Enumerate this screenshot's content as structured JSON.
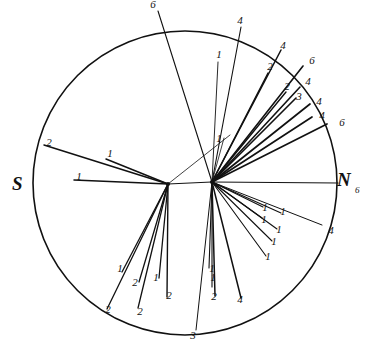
{
  "figure": {
    "background_color": "#ffffff",
    "ink_color": "#111111",
    "circle": {
      "cx": 185,
      "cy": 183,
      "r": 152,
      "stroke_width": 1.6
    },
    "hubs": [
      {
        "name": "left-hub",
        "cx": 168,
        "cy": 184
      },
      {
        "name": "right-hub",
        "cx": 212,
        "cy": 182
      }
    ],
    "cardinals": [
      {
        "name": "south-label",
        "text": "S",
        "x": 12,
        "y": 190
      },
      {
        "name": "north-label",
        "text": "N",
        "x": 337,
        "y": 186
      },
      {
        "name": "north-count",
        "text": "6",
        "x": 355,
        "y": 193
      }
    ]
  },
  "chart_data": {
    "type": "scatter",
    "xlabel": "",
    "ylabel": "",
    "axis_labels": [
      "S",
      "N"
    ],
    "legend": [],
    "grid": false,
    "rays": [
      {
        "hub": "right-hub",
        "x2": 158,
        "y2": 11,
        "label": "6",
        "lx": 153,
        "ly": 8,
        "w": 1.1
      },
      {
        "hub": "right-hub",
        "x2": 241,
        "y2": 27,
        "label": "4",
        "lx": 240,
        "ly": 24,
        "w": 1.1
      },
      {
        "hub": "right-hub",
        "x2": 281,
        "y2": 50,
        "label": "4",
        "lx": 283,
        "ly": 49,
        "w": 1.5
      },
      {
        "hub": "right-hub",
        "x2": 218,
        "y2": 62,
        "label": "1",
        "lx": 219,
        "ly": 58,
        "w": 0.9
      },
      {
        "hub": "right-hub",
        "x2": 268,
        "y2": 73,
        "label": "2",
        "lx": 270,
        "ly": 70,
        "w": 1.4
      },
      {
        "hub": "right-hub",
        "x2": 303,
        "y2": 66,
        "label": "6",
        "lx": 312,
        "ly": 64,
        "w": 1.6
      },
      {
        "hub": "right-hub",
        "x2": 286,
        "y2": 92,
        "label": "2",
        "lx": 287,
        "ly": 90,
        "w": 1.4
      },
      {
        "hub": "right-hub",
        "x2": 300,
        "y2": 87,
        "label": "4",
        "lx": 308,
        "ly": 85,
        "w": 1.6
      },
      {
        "hub": "right-hub",
        "x2": 296,
        "y2": 98,
        "label": "3",
        "lx": 299,
        "ly": 100,
        "w": 1.6
      },
      {
        "hub": "right-hub",
        "x2": 310,
        "y2": 104,
        "label": "4",
        "lx": 319,
        "ly": 105,
        "w": 1.7
      },
      {
        "hub": "right-hub",
        "x2": 312,
        "y2": 117,
        "label": "4",
        "lx": 322,
        "ly": 119,
        "w": 1.7
      },
      {
        "hub": "right-hub",
        "x2": 327,
        "y2": 124,
        "label": "6",
        "lx": 342,
        "ly": 126,
        "w": 1.7
      },
      {
        "hub": "right-hub",
        "x2": 224,
        "y2": 138,
        "label": "1",
        "lx": 219,
        "ly": 142,
        "w": 0.8
      },
      {
        "hub": "right-hub",
        "x2": 338,
        "y2": 183,
        "label": "",
        "lx": 0,
        "ly": 0,
        "w": 1.2
      },
      {
        "hub": "right-hub",
        "x2": 263,
        "y2": 207,
        "label": "1",
        "lx": 265,
        "ly": 211,
        "w": 1.1
      },
      {
        "hub": "right-hub",
        "x2": 262,
        "y2": 218,
        "label": "1",
        "lx": 264,
        "ly": 223,
        "w": 1.1
      },
      {
        "hub": "right-hub",
        "x2": 281,
        "y2": 213,
        "label": "1",
        "lx": 283,
        "ly": 215,
        "w": 1.1
      },
      {
        "hub": "right-hub",
        "x2": 277,
        "y2": 229,
        "label": "1",
        "lx": 279,
        "ly": 233,
        "w": 1.1
      },
      {
        "hub": "right-hub",
        "x2": 272,
        "y2": 241,
        "label": "1",
        "lx": 274,
        "ly": 245,
        "w": 1.1
      },
      {
        "hub": "right-hub",
        "x2": 266,
        "y2": 256,
        "label": "1",
        "lx": 268,
        "ly": 260,
        "w": 1.1
      },
      {
        "hub": "right-hub",
        "x2": 322,
        "y2": 225,
        "label": "4",
        "lx": 331,
        "ly": 234,
        "w": 1.0
      },
      {
        "hub": "right-hub",
        "x2": 209,
        "y2": 268,
        "label": "1",
        "lx": 212,
        "ly": 272,
        "w": 1.1
      },
      {
        "hub": "right-hub",
        "x2": 212,
        "y2": 287,
        "label": "1",
        "lx": 213,
        "ly": 281,
        "w": 1.1
      },
      {
        "hub": "right-hub",
        "x2": 215,
        "y2": 296,
        "label": "2",
        "lx": 214,
        "ly": 300,
        "w": 1.5
      },
      {
        "hub": "right-hub",
        "x2": 241,
        "y2": 298,
        "label": "4",
        "lx": 240,
        "ly": 303,
        "w": 1.5
      },
      {
        "hub": "right-hub",
        "x2": 196,
        "y2": 330,
        "label": "3",
        "lx": 193,
        "ly": 339,
        "w": 1.0
      },
      {
        "hub": "left-hub",
        "x2": 44,
        "y2": 145,
        "label": "2",
        "lx": 49,
        "ly": 146,
        "w": 1.5
      },
      {
        "hub": "left-hub",
        "x2": 106,
        "y2": 159,
        "label": "1",
        "lx": 110,
        "ly": 157,
        "w": 1.5
      },
      {
        "hub": "left-hub",
        "x2": 74,
        "y2": 180,
        "label": "1",
        "lx": 79,
        "ly": 180,
        "w": 1.5
      },
      {
        "hub": "left-hub",
        "x2": 122,
        "y2": 272,
        "label": "1",
        "lx": 120,
        "ly": 272,
        "w": 1.3
      },
      {
        "hub": "left-hub",
        "x2": 107,
        "y2": 309,
        "label": "2",
        "lx": 108,
        "ly": 313,
        "w": 1.3
      },
      {
        "hub": "left-hub",
        "x2": 139,
        "y2": 282,
        "label": "2",
        "lx": 135,
        "ly": 286,
        "w": 1.3
      },
      {
        "hub": "left-hub",
        "x2": 138,
        "y2": 308,
        "label": "2",
        "lx": 140,
        "ly": 315,
        "w": 1.3
      },
      {
        "hub": "left-hub",
        "x2": 159,
        "y2": 278,
        "label": "1",
        "lx": 156,
        "ly": 281,
        "w": 1.3
      },
      {
        "hub": "left-hub",
        "x2": 167,
        "y2": 297,
        "label": "2",
        "lx": 169,
        "ly": 299,
        "w": 1.4
      },
      {
        "hub": "left-hub",
        "x2": 230,
        "y2": 135,
        "label": "",
        "lx": 0,
        "ly": 0,
        "w": 0.8
      },
      {
        "hub": "left-hub",
        "x2": 212,
        "y2": 182,
        "label": "",
        "lx": 0,
        "ly": 0,
        "w": 1.0
      }
    ],
    "label_counts": {
      "1": 16,
      "2": 10,
      "3": 2,
      "4": 8,
      "6": 4
    }
  }
}
